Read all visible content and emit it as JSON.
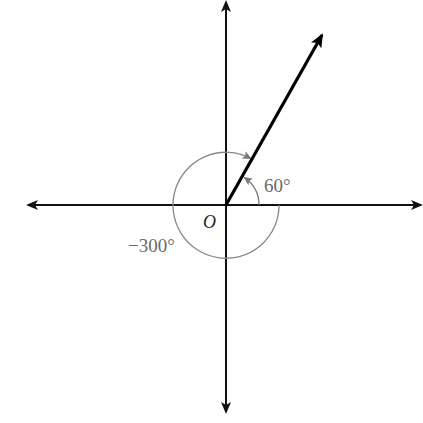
{
  "diagram": {
    "origin_label": "O",
    "angle_positive_label": "60°",
    "angle_negative_label": "−300°",
    "positive_angle_deg": 60,
    "negative_angle_deg": -300,
    "colors": {
      "axes": "#111111",
      "ray": "#000000",
      "arcs": "#7a7a7a",
      "labels": "#6a6a6a"
    }
  }
}
